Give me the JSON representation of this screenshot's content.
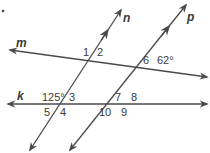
{
  "diagram": {
    "lines": {
      "m": {
        "label": "m",
        "x1": 10,
        "y1": 50,
        "x2": 207,
        "y2": 77
      },
      "k": {
        "label": "k",
        "x1": 8,
        "y1": 104,
        "x2": 207,
        "y2": 104
      },
      "n": {
        "label": "n",
        "x1": 30,
        "y1": 150,
        "x2": 121,
        "y2": 10
      },
      "p": {
        "label": "p",
        "x1": 70,
        "y1": 150,
        "x2": 186,
        "y2": 5
      }
    },
    "angles": {
      "a1": "1",
      "a2": "2",
      "a3": "3",
      "a4": "4",
      "a5": "5",
      "a6": "6",
      "a7": "7",
      "a8": "8",
      "a9": "9",
      "a10": "10",
      "given_k_n": "125°",
      "given_m_p": "62°"
    },
    "colors": {
      "line": "#4a4a4a",
      "text": "#3a3a3a",
      "background": "#ffffff"
    }
  }
}
